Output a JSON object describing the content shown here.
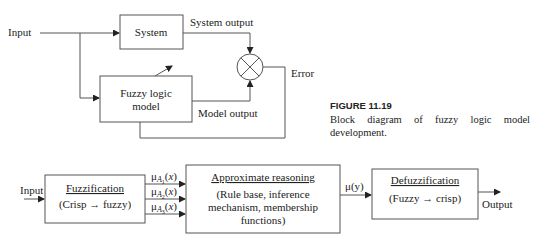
{
  "figure1": {
    "input_label": "Input",
    "system_label": "System",
    "system_output_label": "System output",
    "model_label_line1": "Fuzzy logic",
    "model_label_line2": "model",
    "model_output_label": "Model output",
    "error_label": "Error",
    "comparator_icon": "summing-junction-x-circle"
  },
  "caption": {
    "title": "FIGURE 11.19",
    "text": "Block diagram of fuzzy logic model development."
  },
  "figure2": {
    "input_label": "Input",
    "fuzzification_title": "Fuzzification",
    "fuzzification_sub": "(Crisp → fuzzy)",
    "membership_labels": [
      "μA1(x)",
      "μA2(x)",
      "μA3(x)"
    ],
    "mu_symbol": "μ",
    "mu_subscripts": [
      "1",
      "2",
      "3"
    ],
    "reasoning_title": "Approximate reasoning",
    "reasoning_line1": "(Rule base, inference",
    "reasoning_line2": "mechanism, membership",
    "reasoning_line3": "functions)",
    "mu_y_label": "μ(y)",
    "defuzzification_title": "Defuzzification",
    "defuzzification_sub": "(Fuzzy → crisp)",
    "output_label": "Output"
  },
  "colors": {
    "line": "#555555",
    "text": "#222222",
    "background": "#ffffff"
  }
}
